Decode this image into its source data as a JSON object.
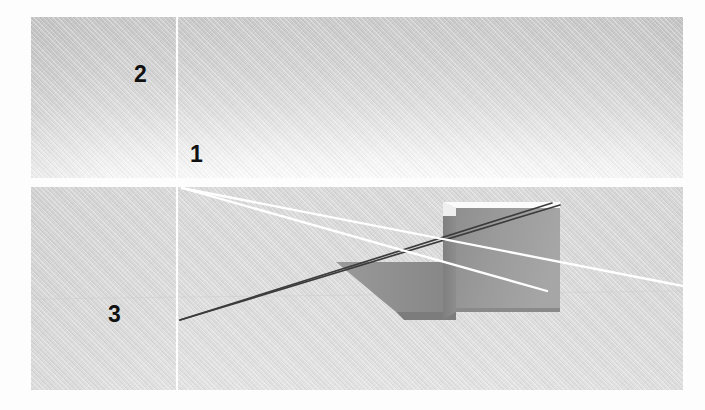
{
  "figure": {
    "background_color": "#fdfdfd",
    "panels": [
      {
        "id": "top-panel",
        "name": "upper-scene-panel",
        "x": 31,
        "y": 17,
        "width": 652,
        "height": 161,
        "description": "plain graded backdrop with vertical reference line",
        "base_color_top": "#c9c9c9",
        "base_color_bottom": "#fdfdfd"
      },
      {
        "id": "bottom-panel",
        "name": "lower-scene-panel",
        "x": 31,
        "y": 187,
        "width": 652,
        "height": 203,
        "description": "scene with cuboid, cast shadow and light rays",
        "base_color_top": "#d9d9d9",
        "base_color_bottom": "#e3e3e3"
      }
    ]
  },
  "labels": [
    {
      "id": "label-2",
      "text": "2",
      "x": 134,
      "y": 63,
      "color": "#111111"
    },
    {
      "id": "label-1",
      "text": "1",
      "x": 190,
      "y": 143,
      "color": "#111111"
    },
    {
      "id": "label-3",
      "text": "3",
      "x": 108,
      "y": 303,
      "color": "#111111"
    }
  ],
  "geometry": {
    "vertical_line": {
      "name": "vertical-reference-line",
      "color": "#ffffff",
      "width": 2.0,
      "top_panel": {
        "x": 177,
        "y1": 17,
        "y2": 178
      },
      "bottom_panel": {
        "x": 177,
        "y1": 187,
        "y2": 390
      }
    },
    "white_rays": {
      "color": "#ffffff",
      "width": 2.2,
      "origin": {
        "x": 182,
        "y": 188
      },
      "lines": [
        {
          "name": "white-ray-upper",
          "x1": 182,
          "y1": 188,
          "x2": 683,
          "y2": 286
        },
        {
          "name": "white-ray-lower",
          "x1": 182,
          "y1": 188,
          "x2": 547,
          "y2": 291
        }
      ]
    },
    "dark_rays": {
      "color": "#3a3a3a",
      "width": 1.6,
      "origin": {
        "x": 180,
        "y": 320
      },
      "lines": [
        {
          "name": "dark-ray-upper",
          "x1": 180,
          "y1": 320,
          "x2": 552,
          "y2": 203
        },
        {
          "name": "dark-ray-lower",
          "x1": 180,
          "y1": 320,
          "x2": 560,
          "y2": 205
        }
      ]
    },
    "cuboid": {
      "name": "cuboid-object",
      "front_face": {
        "x": 456,
        "y": 208,
        "width": 104,
        "height": 104,
        "color": "#9a9a9a"
      },
      "left_face": {
        "color": "#8a8a8a"
      },
      "top_edge_highlight": {
        "color": "#fcfcfc"
      },
      "bottom_front_edge": {
        "color": "#7d7d7d"
      }
    },
    "shadow": {
      "name": "cast-shadow",
      "color": "#8e8e8e",
      "points": "456,262 456,312 396,312 336,262"
    }
  }
}
